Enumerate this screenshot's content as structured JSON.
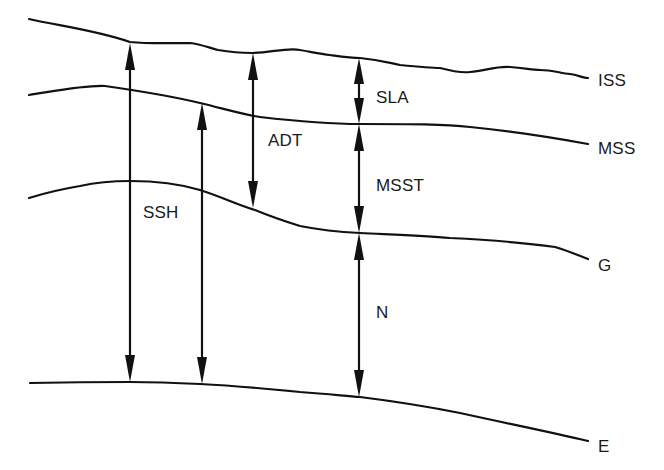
{
  "diagram": {
    "colors": {
      "background": "#ffffff",
      "line": "#111111",
      "text": "#1a1a1a"
    },
    "surfaces": [
      {
        "id": "iss",
        "label": "ISS"
      },
      {
        "id": "mss",
        "label": "MSS"
      },
      {
        "id": "g",
        "label": "G"
      },
      {
        "id": "e",
        "label": "E"
      }
    ],
    "quantities": [
      {
        "id": "ssh",
        "label": "SSH"
      },
      {
        "id": "adt",
        "label": "ADT"
      },
      {
        "id": "sla",
        "label": "SLA"
      },
      {
        "id": "msst",
        "label": "MSST"
      },
      {
        "id": "n",
        "label": "N"
      }
    ]
  }
}
